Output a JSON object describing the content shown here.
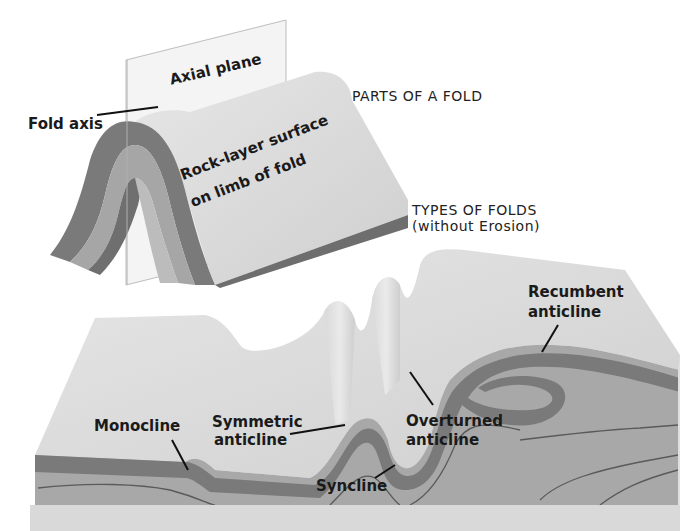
{
  "diagram": {
    "parts_section": {
      "title": "PARTS OF A FOLD",
      "labels": {
        "axial_plane": "Axial plane",
        "fold_axis": "Fold axis",
        "rock_layer_line1": "Rock-layer surface",
        "rock_layer_line2": "on  limb of fold"
      }
    },
    "types_section": {
      "title": "TYPES OF FOLDS",
      "subtitle": "(without Erosion)",
      "labels": {
        "monocline": "Monocline",
        "symmetric_line1": "Symmetric",
        "symmetric_line2": "anticline",
        "syncline": "Syncline",
        "overturned_line1": "Overturned",
        "overturned_line2": "anticline",
        "recumbent_line1": "Recumbent",
        "recumbent_line2": "anticline"
      }
    },
    "colors": {
      "background": "#ffffff",
      "surface": "#d9d9d9",
      "dark_layer": "#7a7a7a",
      "mid_layer": "#a3a3a3",
      "light_layer": "#b4b4b4",
      "outline": "#5a5a5a",
      "text": "#1a1a1a"
    }
  }
}
